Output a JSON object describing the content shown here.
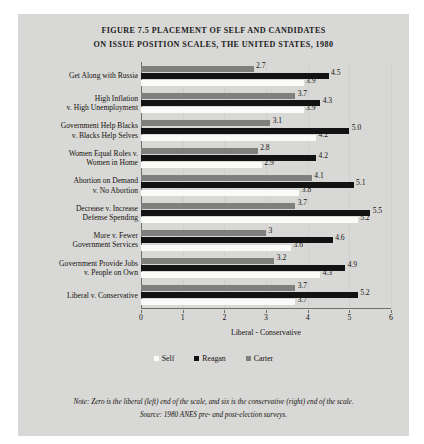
{
  "title": {
    "line1": "FIGURE 7.5 PLACEMENT OF SELF AND CANDIDATES",
    "line2": "ON ISSUE POSITION SCALES, THE UNITED STATES, 1980"
  },
  "footnotes": {
    "note": "Note: Zero is the liberal (left) end of the scale, and six is the conservative (right) end of the scale.",
    "source": "Source: 1980 ANES pre- and post-election surveys."
  },
  "legend": {
    "items": [
      {
        "label": "Self",
        "color": "#fafaf8",
        "key": "self"
      },
      {
        "label": "Reagan",
        "color": "#121212",
        "key": "reagan"
      },
      {
        "label": "Carter",
        "color": "#7f7f7d",
        "key": "carter"
      }
    ]
  },
  "chart_data": {
    "type": "bar",
    "orientation": "horizontal",
    "title": "FIGURE 7.5 PLACEMENT OF SELF AND CANDIDATES ON ISSUE POSITION SCALES, THE UNITED STATES, 1980",
    "xlabel": "Liberal - Conservative",
    "ylabel": "",
    "xlim": [
      0,
      6
    ],
    "xticks": [
      0,
      1,
      2,
      3,
      4,
      5,
      6
    ],
    "xtick_labels": [
      "0",
      "1",
      "2",
      "3",
      "4",
      "5",
      "6"
    ],
    "grid": true,
    "legend_position": "bottom",
    "categories": [
      "Get Along with Russia",
      "High Inflation\nv. High Unemployment",
      "Government Help Blacks\nv. Blacks Help Selves",
      "Women Equal Roles v.\nWomen in Home",
      "Abortion on Demand\nv. No Abortion",
      "Decrease v. Increase\nDefense Spending",
      "More v. Fewer\nGovernment Services",
      "Government Provide Jobs\nv. People on Own",
      "Liberal v. Conservative"
    ],
    "series": [
      {
        "name": "Carter",
        "color": "#7f7f7d",
        "values": [
          2.7,
          3.7,
          3.1,
          2.8,
          4.1,
          3.7,
          3.0,
          3.2,
          3.7
        ],
        "labels": [
          "2.7",
          "3.7",
          "3.1",
          "2.8",
          "4.1",
          "3.7",
          "3",
          "3.2",
          "3.7"
        ]
      },
      {
        "name": "Reagan",
        "color": "#121212",
        "values": [
          4.5,
          4.3,
          5.0,
          4.2,
          5.1,
          5.5,
          4.6,
          4.9,
          5.2
        ],
        "labels": [
          "4.5",
          "4.3",
          "5.0",
          "4.2",
          "5.1",
          "5.5",
          "4.6",
          "4.9",
          "5.2"
        ]
      },
      {
        "name": "Self",
        "color": "#fafaf8",
        "values": [
          3.9,
          3.9,
          4.2,
          2.9,
          3.8,
          5.2,
          3.6,
          4.3,
          3.7
        ],
        "labels": [
          "3.9",
          "3.9",
          "4.2",
          "2.9",
          "3.8",
          "5.2",
          "3.6",
          "4.3",
          "3.7"
        ]
      }
    ]
  }
}
